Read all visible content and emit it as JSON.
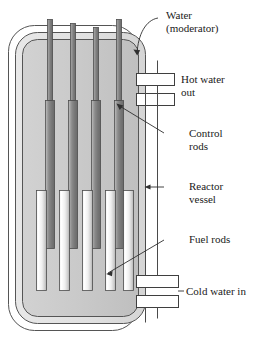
{
  "diagram": {
    "labels": [
      {
        "id": "water-moderator",
        "line1": "Water",
        "line2": "(moderator)"
      },
      {
        "id": "hot-water-out",
        "line1": "Hot water",
        "line2": "out"
      },
      {
        "id": "control-rods",
        "line1": "Control",
        "line2": "rods"
      },
      {
        "id": "reactor-vessel",
        "line1": "Reactor",
        "line2": "vessel"
      },
      {
        "id": "fuel-rods",
        "line1": "Fuel rods",
        "line2": ""
      },
      {
        "id": "cold-water-in",
        "line1": "Cold water in",
        "line2": ""
      }
    ],
    "colors": {
      "stroke": "#3a3a3a",
      "moderator_fill": "#c8c8c8",
      "shell_fill": "#e2e2e2",
      "pipe_fill": "#ffffff",
      "control_rod_light": "#d8d8d8",
      "control_rod_dark": "#6f6f6f",
      "fuel_rod_light": "#ffffff",
      "fuel_rod_dark": "#b4b4b4",
      "background": "#ffffff"
    },
    "components": {
      "control_rod_count": 4,
      "fuel_rod_count": 5,
      "hot_water_pipe_count": 2,
      "cold_water_pipe_count": 2
    }
  }
}
